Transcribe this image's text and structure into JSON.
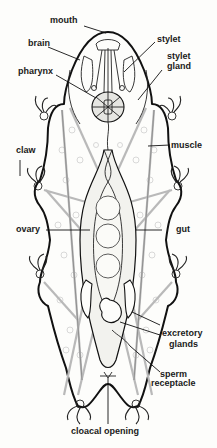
{
  "figure": {
    "labels": {
      "mouth": "mouth",
      "brain": "brain",
      "stylet": "stylet",
      "stylet_gland_line1": "stylet",
      "stylet_gland_line2": "gland",
      "pharynx": "pharynx",
      "claw": "claw",
      "muscle": "muscle",
      "ovary": "ovary",
      "gut": "gut",
      "excretory_glands_line1": "excretory",
      "excretory_glands_line2": "glands",
      "sperm_receptacle_line1": "sperm",
      "sperm_receptacle_line2": "receptacle",
      "cloacal_opening": "cloacal opening"
    }
  }
}
